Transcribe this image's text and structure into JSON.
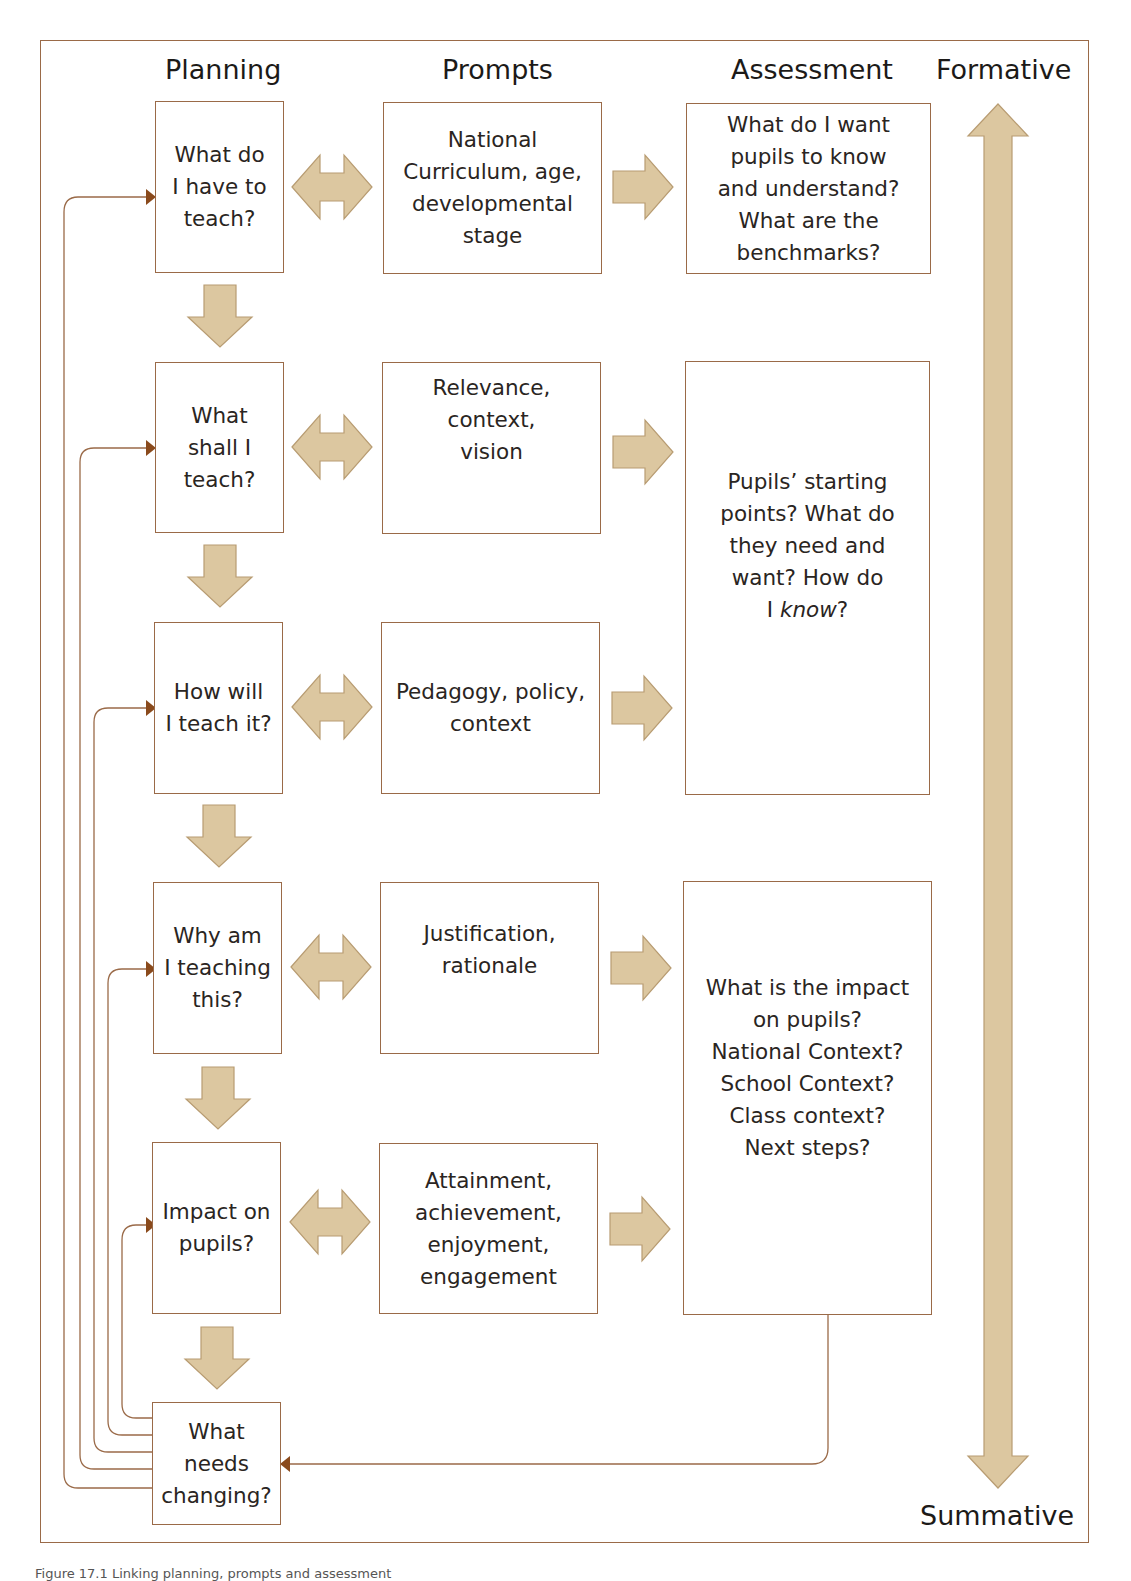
{
  "figure": {
    "column_headers": {
      "planning": "Planning",
      "prompts": "Prompts",
      "assessment": "Assessment",
      "formative": "Formative",
      "summative": "Summative"
    },
    "planning_steps": [
      {
        "label": "What do\nI have to\nteach?"
      },
      {
        "label": "What\nshall I\nteach?"
      },
      {
        "label": "How will\nI teach it?"
      },
      {
        "label": "Why am\nI teaching\nthis?"
      },
      {
        "label": "Impact on\npupils?"
      },
      {
        "label": "What\nneeds\nchanging?"
      }
    ],
    "prompts": [
      {
        "label": "National\nCurriculum, age,\ndevelopmental\nstage"
      },
      {
        "label": "Relevance,\ncontext,\nvision"
      },
      {
        "label": "Pedagogy, policy,\ncontext"
      },
      {
        "label": "Justification,\nrationale"
      },
      {
        "label": "Attainment,\nachievement,\nenjoyment,\nengagement"
      }
    ],
    "assessment": [
      {
        "label": "What do I want\npupils to know\nand understand?\nWhat are the\nbenchmarks?"
      },
      {
        "label_pre": "Pupils’ starting\npoints? What do\nthey need and\nwant? How do\nI ",
        "label_em": "know",
        "label_post": "?"
      },
      {
        "label": "What is the impact\non pupils?\nNational Context?\nSchool Context?\nClass context?\nNext steps?"
      }
    ],
    "colors": {
      "line": "#9a6a48",
      "arrow_fill": "#dcc7a0",
      "arrow_stroke": "#b89c72",
      "arrowhead": "#8a4a1c"
    },
    "caption": "Figure 17.1 Linking planning, prompts and assessment"
  }
}
